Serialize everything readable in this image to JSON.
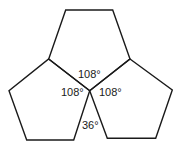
{
  "diagram": {
    "stroke_color": "#1a1a1a",
    "background": "#ffffff",
    "pentagons": [
      {
        "name": "top",
        "points": "65.7,10 112.7,10 130,59 89.7,90.7 48.7,59"
      },
      {
        "name": "left",
        "points": "48.7,59 89.7,90.7 73.7,140 26.7,140 9,90.7"
      },
      {
        "name": "right",
        "points": "130,59 172.3,90 155.7,138.3 107.3,138.3 89.7,90.7"
      }
    ],
    "labels": {
      "top_angle": "108°",
      "left_angle": "108°",
      "right_angle": "108°",
      "gap_angle": "36°"
    }
  }
}
